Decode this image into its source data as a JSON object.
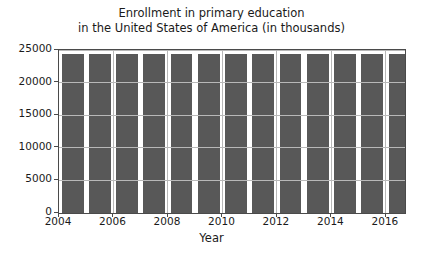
{
  "chart_data": {
    "type": "bar",
    "title": "Enrollment in primary education\nin the United States of America (in thousands)",
    "title_line1": "Enrollment in primary education",
    "title_line2": "in the United States of America (in thousands)",
    "xlabel": "Year",
    "ylabel": "",
    "categories": [
      2004,
      2005,
      2006,
      2007,
      2008,
      2009,
      2010,
      2011,
      2012,
      2013,
      2014,
      2015,
      2016
    ],
    "values": [
      24400,
      24400,
      24400,
      24400,
      24400,
      24400,
      24400,
      24400,
      24400,
      24400,
      24400,
      24400,
      24400
    ],
    "xlim": [
      2004,
      2016.7
    ],
    "ylim": [
      0,
      25000
    ],
    "yticks": [
      0,
      5000,
      10000,
      15000,
      20000,
      25000
    ],
    "ytick_labels": [
      "0",
      "5000",
      "10000",
      "15000",
      "20000",
      "25000"
    ],
    "xticks": [
      2004,
      2006,
      2008,
      2010,
      2012,
      2014,
      2016
    ],
    "xtick_labels": [
      "2004",
      "2006",
      "2008",
      "2010",
      "2012",
      "2014",
      "2016"
    ],
    "grid": true,
    "legend": null,
    "bar_color": "#585858",
    "grid_color": "#b8b8b8",
    "axis_color": "#4a4a4a",
    "text_color": "#1a1a1a"
  }
}
